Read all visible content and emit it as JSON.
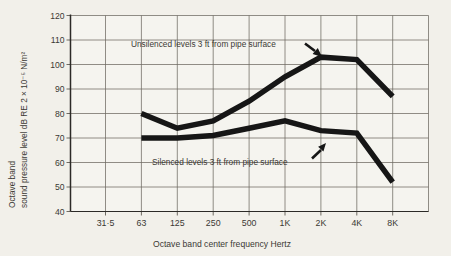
{
  "figure": {
    "background": "#f2f0ea",
    "plot_background": "#f5f4ef",
    "ink_color": "#161616",
    "grid_color": "#6e6a62",
    "text_color": "#3b3934"
  },
  "chart_data": {
    "type": "line",
    "title": "",
    "xlabel": "Octave band center frequency Hertz",
    "ylabel_line1": "Octave band",
    "ylabel_line2": "sound pressure level dB RE 2 × 10⁻⁵ N/m²",
    "categories": [
      "31·5",
      "63",
      "125",
      "250",
      "500",
      "1K",
      "2K",
      "4K",
      "8K"
    ],
    "y_ticks": [
      120,
      110,
      100,
      90,
      80,
      70,
      60,
      50,
      40
    ],
    "ylim": [
      40,
      120
    ],
    "grid": true,
    "legend_position": "inline-annotations",
    "series": [
      {
        "name": "unsilenced",
        "label": "Unsilenced levels 3 ft from pipe surface",
        "start_category_index": 1,
        "x": [
          "63",
          "125",
          "250",
          "500",
          "1K",
          "2K",
          "4K",
          "8K"
        ],
        "values": [
          80,
          74,
          77,
          85,
          95,
          103,
          102,
          87
        ]
      },
      {
        "name": "silenced",
        "label": "Silenced levels 3 ft from pipe surface",
        "start_category_index": 1,
        "x": [
          "63",
          "125",
          "250",
          "500",
          "1K",
          "2K",
          "4K",
          "8K"
        ],
        "values": [
          70,
          70,
          71,
          74,
          77,
          73,
          72,
          52
        ]
      }
    ]
  }
}
